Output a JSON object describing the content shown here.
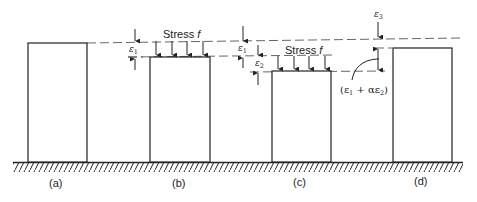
{
  "diagram": {
    "type": "creep-and-recovery schematic",
    "stress_label": "Stress f",
    "panels": [
      {
        "id": "a",
        "caption": "(a)",
        "block": {
          "x": 28,
          "top": 43,
          "width": 59
        }
      },
      {
        "id": "b",
        "caption": "(b)",
        "block": {
          "x": 150,
          "top": 57,
          "width": 60
        },
        "stress_label": "Stress f",
        "arrows": 4,
        "dims": [
          "ε1"
        ]
      },
      {
        "id": "c",
        "caption": "(c)",
        "block": {
          "x": 272,
          "top": 71,
          "width": 59
        },
        "stress_label": "Stress f",
        "arrows": 4,
        "dims": [
          "ε1",
          "ε2"
        ]
      },
      {
        "id": "d",
        "caption": "(d)",
        "block": {
          "x": 393,
          "top": 48,
          "width": 59
        },
        "dims": [
          "ε3"
        ],
        "annotation": "(ε1 + αε2)"
      }
    ],
    "labels": {
      "stress_b": "Stress ",
      "stress_c": "Stress ",
      "f": "f",
      "eps": "ε",
      "one": "1",
      "two": "2",
      "three": "3",
      "alpha_expr_open": "(ε",
      "alpha_expr_plus": " + αε",
      "alpha_expr_close": ")",
      "cap_a": "(a)",
      "cap_b": "(b)",
      "cap_c": "(c)",
      "cap_d": "(d)"
    },
    "ground_y": 162,
    "colors": {
      "line": "#222222",
      "dash": "#555555",
      "background": "#ffffff"
    }
  }
}
